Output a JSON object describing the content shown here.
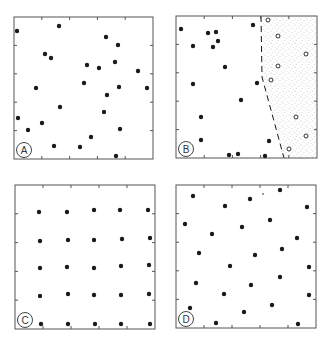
{
  "figure": {
    "ink_color": "#1a1a1a",
    "stipple_color": "#8a8a8a",
    "panels": [
      {
        "label": "A",
        "pattern": "random",
        "box": [
          14,
          17,
          153,
          159
        ],
        "filled": [
          [
            17,
            31
          ],
          [
            59,
            26
          ],
          [
            106,
            37
          ],
          [
            118,
            45
          ],
          [
            45,
            54
          ],
          [
            51,
            58
          ],
          [
            87,
            65
          ],
          [
            99,
            68
          ],
          [
            115,
            62
          ],
          [
            138,
            71
          ],
          [
            36,
            88
          ],
          [
            84,
            83
          ],
          [
            119,
            87
          ],
          [
            147,
            88
          ],
          [
            107,
            95
          ],
          [
            60,
            107
          ],
          [
            104,
            112
          ],
          [
            18,
            118
          ],
          [
            42,
            123
          ],
          [
            28,
            130
          ],
          [
            120,
            129
          ],
          [
            91,
            137
          ],
          [
            54,
            146
          ],
          [
            80,
            147
          ],
          [
            116,
            156
          ]
        ],
        "open": []
      },
      {
        "label": "B",
        "pattern": "clustered with shaded region",
        "box": [
          176,
          16,
          317,
          158
        ],
        "filled": [
          [
            181,
            29
          ],
          [
            208,
            33
          ],
          [
            216,
            32
          ],
          [
            253,
            25
          ],
          [
            218,
            41
          ],
          [
            193,
            46
          ],
          [
            213,
            47
          ],
          [
            225,
            67
          ],
          [
            193,
            84
          ],
          [
            257,
            83
          ],
          [
            241,
            100
          ],
          [
            201,
            117
          ],
          [
            201,
            140
          ],
          [
            269,
            141
          ],
          [
            229,
            155
          ],
          [
            238,
            154
          ],
          [
            265,
            156
          ]
        ],
        "open": [
          [
            268,
            20
          ],
          [
            278,
            36
          ],
          [
            306,
            54
          ],
          [
            278,
            66
          ],
          [
            271,
            80
          ],
          [
            296,
            117
          ],
          [
            306,
            136
          ],
          [
            289,
            149
          ]
        ],
        "boundary": [
          [
            261,
            16
          ],
          [
            262,
            77
          ],
          [
            284,
            158
          ]
        ]
      },
      {
        "label": "C",
        "pattern": "regular grid",
        "box": [
          15,
          185,
          155,
          329
        ],
        "filled": [
          [
            39,
            212
          ],
          [
            67,
            212
          ],
          [
            94,
            210
          ],
          [
            120,
            210
          ],
          [
            148,
            210
          ],
          [
            40,
            241
          ],
          [
            68,
            240
          ],
          [
            94,
            240
          ],
          [
            122,
            239
          ],
          [
            150,
            238
          ],
          [
            40,
            268
          ],
          [
            67,
            267
          ],
          [
            94,
            268
          ],
          [
            121,
            266
          ],
          [
            149,
            265
          ],
          [
            40,
            296
          ],
          [
            68,
            294
          ],
          [
            94,
            295
          ],
          [
            121,
            295
          ],
          [
            149,
            294
          ],
          [
            41,
            324
          ],
          [
            68,
            324
          ],
          [
            95,
            324
          ],
          [
            121,
            324
          ],
          [
            150,
            324
          ]
        ],
        "open": []
      },
      {
        "label": "D",
        "pattern": "dispersed",
        "box": [
          176,
          185,
          316,
          328
        ],
        "filled": [
          [
            193,
            196
          ],
          [
            225,
            206
          ],
          [
            250,
            199
          ],
          [
            280,
            190
          ],
          [
            307,
            207
          ],
          [
            185,
            224
          ],
          [
            270,
            220
          ],
          [
            242,
            227
          ],
          [
            212,
            234
          ],
          [
            297,
            238
          ],
          [
            199,
            253
          ],
          [
            255,
            255
          ],
          [
            282,
            249
          ],
          [
            230,
            266
          ],
          [
            309,
            267
          ],
          [
            196,
            283
          ],
          [
            251,
            285
          ],
          [
            280,
            277
          ],
          [
            224,
            294
          ],
          [
            309,
            295
          ],
          [
            272,
            305
          ],
          [
            190,
            308
          ],
          [
            244,
            312
          ],
          [
            216,
            323
          ],
          [
            298,
            324
          ]
        ],
        "open": [],
        "specks": [
          [
            263,
            194
          ]
        ]
      }
    ]
  }
}
